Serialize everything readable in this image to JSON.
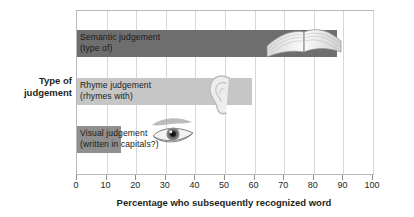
{
  "chart_data": {
    "type": "bar",
    "orientation": "horizontal",
    "title": "",
    "xlabel": "Percentage who subsequently recognized word",
    "ylabel": "Type of judgement",
    "xlim": [
      0,
      100
    ],
    "xticks": [
      0,
      10,
      20,
      30,
      40,
      50,
      60,
      70,
      80,
      90,
      100
    ],
    "grid": "vertical",
    "legend": "none",
    "categories": [
      "Semantic judgement (type of)",
      "Rhyme judgement (rhymes with)",
      "Visual judgement (written in capitals?)"
    ],
    "values": [
      88,
      59,
      15
    ],
    "bars": [
      {
        "label_line1": "Semantic judgement",
        "label_line2": "(type of)",
        "value": 88,
        "color": "#6e6e6e",
        "icon": "open-book-icon"
      },
      {
        "label_line1": "Rhyme judgement",
        "label_line2": "(rhymes with)",
        "value": 59,
        "color": "#c6c6c6",
        "icon": "ear-icon"
      },
      {
        "label_line1": "Visual judgement",
        "label_line2": "(written in capitals?)",
        "value": 15,
        "color": "#8f8f8f",
        "icon": "eye-icon"
      }
    ]
  },
  "axis": {
    "y_title_line1": "Type of",
    "y_title_line2": "judgement",
    "x_title": "Percentage who subsequently recognized word",
    "tick_labels": [
      "0",
      "10",
      "20",
      "30",
      "40",
      "50",
      "60",
      "70",
      "80",
      "90",
      "100"
    ]
  },
  "colors": {
    "bar_semantic": "#6e6e6e",
    "bar_rhyme": "#c6c6c6",
    "bar_visual": "#8f8f8f",
    "frame": "#b9b9bb",
    "gridline": "#d7d7d9",
    "text": "#231f20"
  }
}
